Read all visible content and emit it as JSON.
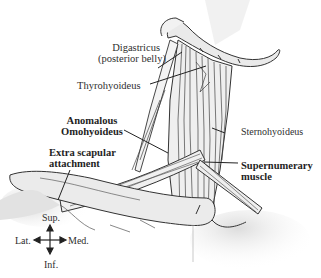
{
  "figure": {
    "type": "anatomical illustration"
  },
  "labels": {
    "digastricus_line1": "Digastricus",
    "digastricus_line2": "(posterior belly)",
    "thyrohyoideus": "Thyrohyoideus",
    "sternohyoideus": "Sternohyoideus",
    "anomalous_line1": "Anomalous",
    "anomalous_line2": "Omohyoideus",
    "extra_line1": "Extra scapular",
    "extra_line2": "attachment",
    "supernumerary_line1": "Supernumerary",
    "supernumerary_line2": "muscle"
  },
  "compass": {
    "up": "Sup.",
    "down": "Inf.",
    "left": "Lat.",
    "right": "Med."
  },
  "colors": {
    "ink": "#2a2a2a",
    "shade": "#d9d9d9",
    "background": "#ffffff"
  }
}
